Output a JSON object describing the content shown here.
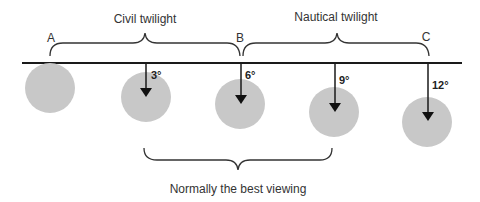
{
  "labels": {
    "civil_twilight": "Civil twilight",
    "nautical_twilight": "Nautical twilight",
    "best_viewing": "Normally the best viewing",
    "point_a": "A",
    "point_b": "B",
    "point_c": "C"
  },
  "degrees": {
    "d3": "3°",
    "d6": "6°",
    "d9": "9°",
    "d12": "12°"
  },
  "colors": {
    "sun": "#c8c8c8",
    "line": "#1a1a1a",
    "text": "#333333"
  }
}
